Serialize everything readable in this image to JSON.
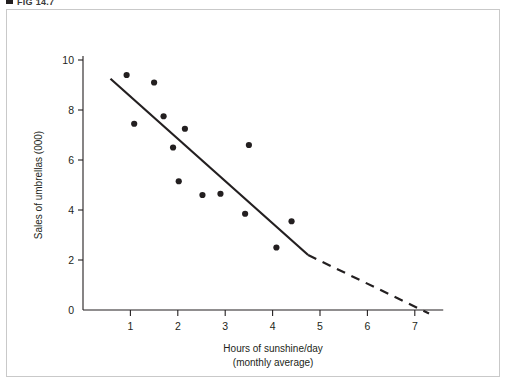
{
  "figure": {
    "caption": "FIG 14.7",
    "caption_marker_icon": "square-bullet-icon"
  },
  "chart_data": {
    "type": "scatter",
    "title": "",
    "xlabel_line1": "Hours of sunshine/day",
    "xlabel_line2": "(monthly average)",
    "ylabel": "Sales of umbrellas (000)",
    "xlim": [
      0,
      7.6
    ],
    "ylim": [
      0,
      10.8
    ],
    "xticks": [
      1,
      2,
      3,
      4,
      5,
      6,
      7
    ],
    "yticks": [
      0,
      2,
      4,
      6,
      8,
      10
    ],
    "xtick_labels": [
      "1",
      "2",
      "3",
      "4",
      "5",
      "6",
      "7"
    ],
    "ytick_labels": [
      "0",
      "2",
      "4",
      "6",
      "8",
      "10"
    ],
    "grid": false,
    "legend": "none",
    "series": [
      {
        "name": "Monthly observations",
        "marker": "filled-circle",
        "color": "#231f20",
        "points": [
          {
            "x": 0.92,
            "y": 9.4
          },
          {
            "x": 1.08,
            "y": 7.45
          },
          {
            "x": 1.5,
            "y": 9.1
          },
          {
            "x": 1.7,
            "y": 7.75
          },
          {
            "x": 1.9,
            "y": 6.5
          },
          {
            "x": 2.15,
            "y": 7.25
          },
          {
            "x": 2.02,
            "y": 5.15
          },
          {
            "x": 2.52,
            "y": 4.6
          },
          {
            "x": 2.9,
            "y": 4.65
          },
          {
            "x": 3.42,
            "y": 3.85
          },
          {
            "x": 3.5,
            "y": 6.6
          },
          {
            "x": 4.08,
            "y": 2.5
          },
          {
            "x": 4.4,
            "y": 3.55
          }
        ]
      }
    ],
    "trend_line": {
      "name": "Line of best fit",
      "color": "#231f20",
      "solid_segment": {
        "x1": 0.58,
        "y1": 9.25,
        "x2": 4.75,
        "y2": 2.2
      },
      "dashed_segment": {
        "x1": 4.75,
        "y1": 2.2,
        "x2": 7.3,
        "y2": -0.14
      },
      "x_intercept": 6.2
    }
  }
}
